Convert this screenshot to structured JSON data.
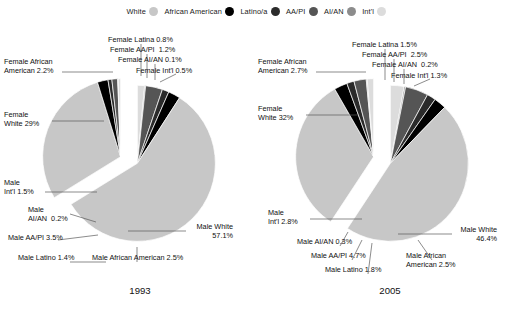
{
  "legend": {
    "items": [
      {
        "label": "White",
        "icon": "legend-dot-white",
        "color": "#c7c7c7"
      },
      {
        "label": "African American",
        "icon": "legend-dot-african-american",
        "color": "#000000"
      },
      {
        "label": "Latino/a",
        "icon": "legend-dot-latino",
        "color": "#2b2b2b"
      },
      {
        "label": "AA/PI",
        "icon": "legend-dot-aapi",
        "color": "#555555"
      },
      {
        "label": "AI/AN",
        "icon": "legend-dot-aian",
        "color": "#8c8c8c"
      },
      {
        "label": "Int'l",
        "icon": "legend-dot-intl",
        "color": "#dcdcdc"
      }
    ]
  },
  "charts": [
    {
      "year": "1993",
      "labels": {
        "female_white": "Female\nWhite 29%",
        "female_african_american": "Female African\nAmerican 2.2%",
        "female_latina": "Female Latina 0.8%",
        "female_aapi": "Female AA/PI  1.2%",
        "female_aian": "Female AI/AN 0.1%",
        "female_intl": "Female Int'l 0.5%",
        "male_white": "Male White\n57.1%",
        "male_african_american": "Male African American 2.5%",
        "male_latino": "Male Latino 1.4%",
        "male_aapi": "Male AA/PI 3.5%",
        "male_aian": "Male\nAI/AN  0.2%",
        "male_intl": "Male\nInt'l 1.5%"
      }
    },
    {
      "year": "2005",
      "labels": {
        "female_white": "Female\nWhite 32%",
        "female_african_american": "Female African\nAmerican 2.7%",
        "female_latina": "Female Latina 1.5%",
        "female_aapi": "Female AA/PI  2.5%",
        "female_aian": "Female AI/AN  0.2%",
        "female_intl": "Female Int'l 1.3%",
        "male_white": "Male White\n46.4%",
        "male_african_american": "Male African\nAmerican 2.5%",
        "male_latino": "Male Latino 1.8%",
        "male_aapi": "Male AA/PI 4.7%",
        "male_aian": "Male AI/AN 0.3%",
        "male_intl": "Male\nInt'l 2.8%"
      }
    }
  ],
  "chart_data": {
    "type": "pie",
    "title": "",
    "note": "Two exploded pie charts comparing degree recipients by gender and race/ethnicity, 1993 vs 2005. Each pie is split into a Female group (exploded up-left) and a Male group (exploded down-right).",
    "legend_position": "top-center",
    "categories": [
      "White",
      "African American",
      "Latino/a",
      "AA/PI",
      "AI/AN",
      "Int'l"
    ],
    "colors": {
      "White": "#c7c7c7",
      "African American": "#000000",
      "Latino/a": "#2b2b2b",
      "AA/PI": "#555555",
      "AI/AN": "#8c8c8c",
      "Int'l": "#dcdcdc"
    },
    "charts": [
      {
        "title": "1993",
        "slices": [
          {
            "label": "Female White",
            "value": 29.0,
            "group": "Female",
            "race": "White"
          },
          {
            "label": "Female African American",
            "value": 2.2,
            "group": "Female",
            "race": "African American"
          },
          {
            "label": "Female Latina",
            "value": 0.8,
            "group": "Female",
            "race": "Latino/a"
          },
          {
            "label": "Female AA/PI",
            "value": 1.2,
            "group": "Female",
            "race": "AA/PI"
          },
          {
            "label": "Female AI/AN",
            "value": 0.1,
            "group": "Female",
            "race": "AI/AN"
          },
          {
            "label": "Female Int'l",
            "value": 0.5,
            "group": "Female",
            "race": "Int'l"
          },
          {
            "label": "Male White",
            "value": 57.1,
            "group": "Male",
            "race": "White"
          },
          {
            "label": "Male African American",
            "value": 2.5,
            "group": "Male",
            "race": "African American"
          },
          {
            "label": "Male Latino",
            "value": 1.4,
            "group": "Male",
            "race": "Latino/a"
          },
          {
            "label": "Male AA/PI",
            "value": 3.5,
            "group": "Male",
            "race": "AA/PI"
          },
          {
            "label": "Male AI/AN",
            "value": 0.2,
            "group": "Male",
            "race": "AI/AN"
          },
          {
            "label": "Male Int'l",
            "value": 1.5,
            "group": "Male",
            "race": "Int'l"
          }
        ]
      },
      {
        "title": "2005",
        "slices": [
          {
            "label": "Female White",
            "value": 32.0,
            "group": "Female",
            "race": "White"
          },
          {
            "label": "Female African American",
            "value": 2.7,
            "group": "Female",
            "race": "African American"
          },
          {
            "label": "Female Latina",
            "value": 1.5,
            "group": "Female",
            "race": "Latino/a"
          },
          {
            "label": "Female AA/PI",
            "value": 2.5,
            "group": "Female",
            "race": "AA/PI"
          },
          {
            "label": "Female AI/AN",
            "value": 0.2,
            "group": "Female",
            "race": "AI/AN"
          },
          {
            "label": "Female Int'l",
            "value": 1.3,
            "group": "Female",
            "race": "Int'l"
          },
          {
            "label": "Male White",
            "value": 46.4,
            "group": "Male",
            "race": "White"
          },
          {
            "label": "Male African American",
            "value": 2.5,
            "group": "Male",
            "race": "African American"
          },
          {
            "label": "Male Latino",
            "value": 1.8,
            "group": "Male",
            "race": "Latino/a"
          },
          {
            "label": "Male AA/PI",
            "value": 4.7,
            "group": "Male",
            "race": "AA/PI"
          },
          {
            "label": "Male AI/AN",
            "value": 0.3,
            "group": "Male",
            "race": "AI/AN"
          },
          {
            "label": "Male Int'l",
            "value": 2.8,
            "group": "Male",
            "race": "Int'l"
          }
        ]
      }
    ]
  }
}
